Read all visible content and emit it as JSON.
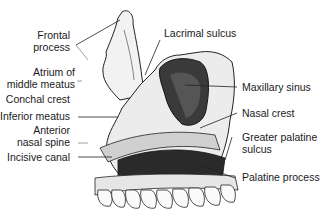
{
  "figure": {
    "labels_left": [
      {
        "id": "frontal-process",
        "lines": [
          "Frontal",
          "process"
        ]
      },
      {
        "id": "atrium-middle-meatus",
        "lines": [
          "Atrium of",
          "middle meatus"
        ]
      },
      {
        "id": "conchal-crest",
        "lines": [
          "Conchal crest"
        ]
      },
      {
        "id": "inferior-meatus",
        "lines": [
          "Inferior meatus"
        ]
      },
      {
        "id": "anterior-nasal-spine",
        "lines": [
          "Anterior",
          "nasal spine"
        ]
      },
      {
        "id": "incisive-canal",
        "lines": [
          "Incisive canal"
        ]
      }
    ],
    "labels_right": [
      {
        "id": "lacrimal-sulcus",
        "lines": [
          "Lacrimal sulcus"
        ]
      },
      {
        "id": "maxillary-sinus",
        "lines": [
          "Maxillary sinus"
        ]
      },
      {
        "id": "nasal-crest",
        "lines": [
          "Nasal crest"
        ]
      },
      {
        "id": "greater-palatine-sulcus",
        "lines": [
          "Greater palatine",
          "sulcus"
        ]
      },
      {
        "id": "palatine-process",
        "lines": [
          "Palatine process"
        ]
      }
    ]
  }
}
